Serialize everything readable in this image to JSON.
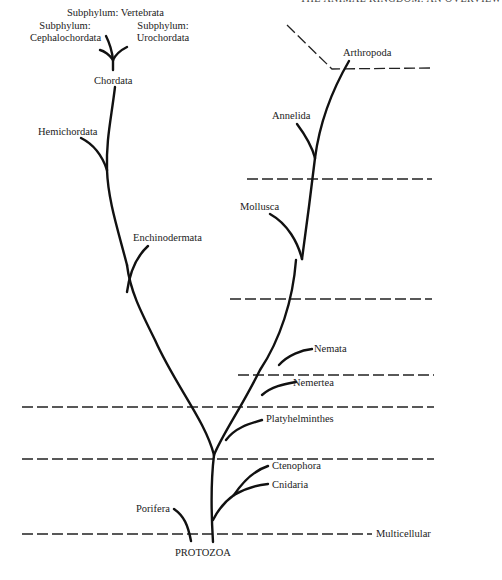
{
  "running_head": "THE ANIMAL KINGDOM: AN OVERVIEW",
  "root": "PROTOZOA",
  "levels": {
    "multicellular": "Multicellular"
  },
  "left_lineage": {
    "porifera": "Porifera",
    "enchinodermata": "Enchinodermata",
    "hemichordata": "Hemichordata",
    "chordata": "Chordata",
    "cephalochordata": "Subphylum:\nCephalochordata",
    "cephalochordata_l1": "Subphylum:",
    "cephalochordata_l2": "Cephalochordata",
    "vertebrata": "Subphylum: Vertebrata",
    "urochordata_l1": "Subphylum:",
    "urochordata_l2": "Urochordata"
  },
  "right_lineage": {
    "cnidaria": "Cnidaria",
    "ctenophora": "Ctenophora",
    "platyhelminthes": "Platyhelminthes",
    "nemertea": "Nemertea",
    "nemata": "Nemata",
    "mollusca": "Mollusca",
    "annelida": "Annelida",
    "arthropoda": "Arthropoda"
  },
  "colors": {
    "line": "#111111",
    "text": "#222222",
    "background": "#ffffff"
  }
}
